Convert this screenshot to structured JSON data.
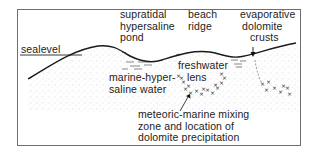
{
  "diagram": {
    "title": "",
    "frame": {
      "stroke": "#6e6e6e"
    },
    "colors": {
      "line": "#1a1a1a",
      "stipple": "#b5b5b5",
      "text": "#222222",
      "marker": "#2a2a2a"
    },
    "labels": {
      "sealevel": "sealevel",
      "pond": [
        "supratidal",
        "hypersaline",
        "pond"
      ],
      "beach": [
        "beach",
        "ridge"
      ],
      "crusts": [
        "evaporative",
        "dolomite",
        "crusts"
      ],
      "marine_water": [
        "marine-hyper-",
        "saline water"
      ],
      "freshwater": [
        "freshwater",
        "lens"
      ],
      "mixing": [
        "meteoric-marine mixing",
        "zone and location of",
        "dolomite precipitation"
      ]
    }
  }
}
